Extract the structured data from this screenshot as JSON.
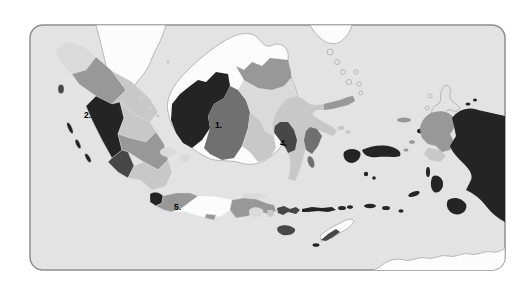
{
  "map": {
    "labels": [
      {
        "text": "1."
      },
      {
        "text": "2."
      },
      {
        "text": "4."
      },
      {
        "text": "5."
      }
    ]
  },
  "colors": {
    "page_bg": "#ffffff",
    "frame_border": "#8e8e8e",
    "sea": "#e3e3e3",
    "white_land": "#fcfcfc",
    "outline": "#a8a8a8",
    "shade1": "#dadada",
    "shade2": "#c8c8c8",
    "shade3": "#989898",
    "shade4": "#707070",
    "shade5": "#474747",
    "shade6": "#242424",
    "label": "#000000"
  }
}
